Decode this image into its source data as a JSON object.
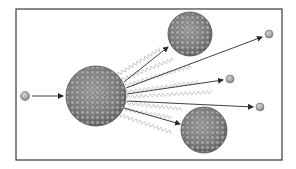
{
  "diagram": {
    "type": "nuclear-fission-illustration",
    "frame": {
      "x": 16,
      "y": 9,
      "width": 266,
      "height": 151,
      "stroke": "#3a3a3a"
    },
    "colors": {
      "nucleus_fill": "#8a8a8a",
      "nucleon_light": "#b8b8b8",
      "nucleon_dark": "#5e5e5e",
      "neutron_fill": "#a8a8a8",
      "arrow": "#2a2a2a",
      "gamma_wave": "#c4c4c4"
    },
    "incoming_neutron": {
      "cx": 25,
      "cy": 96,
      "r": 4.5
    },
    "incoming_arrow": {
      "x1": 32,
      "y1": 96,
      "x2": 63,
      "y2": 96
    },
    "parent_nucleus": {
      "cx": 96,
      "cy": 96,
      "r": 30
    },
    "fragments": [
      {
        "name": "upper-fragment",
        "cx": 190,
        "cy": 34,
        "r": 22
      },
      {
        "name": "lower-fragment",
        "cx": 204,
        "cy": 130,
        "r": 23
      }
    ],
    "fragment_arrows": [
      {
        "x1": 124,
        "y1": 82,
        "x2": 168,
        "y2": 47
      },
      {
        "x1": 124,
        "y1": 108,
        "x2": 180,
        "y2": 124
      }
    ],
    "released_neutrons": [
      {
        "cx": 269,
        "cy": 34,
        "r": 4
      },
      {
        "cx": 230,
        "cy": 79,
        "r": 4
      },
      {
        "cx": 260,
        "cy": 107,
        "r": 4
      }
    ],
    "neutron_arrows": [
      {
        "x1": 126,
        "y1": 88,
        "x2": 262,
        "y2": 37
      },
      {
        "x1": 127,
        "y1": 94,
        "x2": 223,
        "y2": 80
      },
      {
        "x1": 127,
        "y1": 101,
        "x2": 253,
        "y2": 107
      }
    ],
    "gamma_rays": [
      {
        "x1": 117,
        "y1": 75,
        "x2": 162,
        "y2": 48
      },
      {
        "x1": 121,
        "y1": 80,
        "x2": 176,
        "y2": 58
      },
      {
        "x1": 124,
        "y1": 86,
        "x2": 192,
        "y2": 66
      },
      {
        "x1": 125,
        "y1": 92,
        "x2": 200,
        "y2": 82
      },
      {
        "x1": 126,
        "y1": 97,
        "x2": 212,
        "y2": 92
      },
      {
        "x1": 125,
        "y1": 103,
        "x2": 182,
        "y2": 109
      },
      {
        "x1": 122,
        "y1": 109,
        "x2": 174,
        "y2": 118
      },
      {
        "x1": 117,
        "y1": 114,
        "x2": 173,
        "y2": 133
      }
    ]
  }
}
